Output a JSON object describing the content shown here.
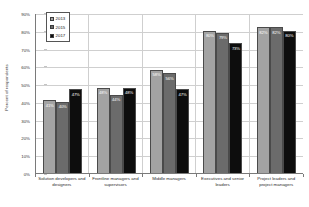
{
  "chart_data": {
    "type": "bar",
    "title": "",
    "subtitle": "",
    "xlabel": "",
    "ylabel": "Percent of respondents",
    "ylim": [
      0,
      90
    ],
    "ytick_step": 10,
    "ytick_labels": [
      "0%",
      "10%",
      "20%",
      "30%",
      "40%",
      "50%",
      "60%",
      "70%",
      "80%",
      "90%"
    ],
    "grid": true,
    "legend_position": "upper-left-inside",
    "categories": [
      "Solution developers and designers",
      "Frontline managers and supervisors",
      "Middle managers",
      "Executives and senior leaders",
      "Project leaders and project managers"
    ],
    "series": [
      {
        "name": "2013",
        "color": "#a3a3a3",
        "values": [
          41,
          48,
          58,
          80,
          82
        ],
        "labels": [
          "41%",
          "48%",
          "58%",
          "80%",
          "82%"
        ]
      },
      {
        "name": "2015",
        "color": "#6b6b6b",
        "values": [
          40,
          44,
          56,
          79,
          82
        ],
        "labels": [
          "40%",
          "44%",
          "56%",
          "79%",
          "82%"
        ]
      },
      {
        "name": "2017",
        "color": "#0d0d0d",
        "values": [
          47,
          48,
          47,
          73,
          80
        ],
        "labels": [
          "47%",
          "48%",
          "47%",
          "73%",
          "80%"
        ]
      }
    ]
  },
  "legend": {
    "items": [
      {
        "label": "2013"
      },
      {
        "label": "2015"
      },
      {
        "label": "2017"
      }
    ]
  },
  "axis": {
    "y_title": "Percent of respondents"
  }
}
